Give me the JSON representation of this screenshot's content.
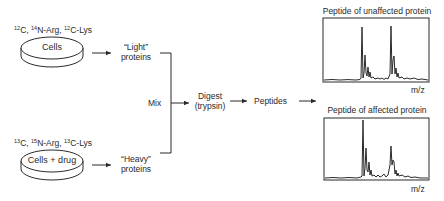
{
  "top_group": {
    "isotope_label": {
      "c": "12",
      "c_text": "C, ",
      "n": "14",
      "n_text": "N-Arg, ",
      "c2": "12",
      "c2_text": "C-Lys"
    },
    "dish_label": "Cells",
    "protein_label_line1": "“Light”",
    "protein_label_line2": "proteins"
  },
  "bottom_group": {
    "isotope_label": {
      "c": "13",
      "c_text": "C, ",
      "n": "15",
      "n_text": "N-Arg, ",
      "c2": "13",
      "c2_text": "C-Lys"
    },
    "dish_label": "Cells + drug",
    "protein_label_line1": "“Heavy”",
    "protein_label_line2": "proteins"
  },
  "steps": {
    "mix": "Mix",
    "digest_line1": "Digest",
    "digest_line2": "(trypsin)",
    "peptides": "Peptides"
  },
  "spectra": [
    {
      "title": "Peptide of unaffected protein",
      "xlabel": "m/z",
      "peak_light_height": 1.0,
      "peak_heavy_height": 1.0
    },
    {
      "title": "Peptide of affected protein",
      "xlabel": "m/z",
      "peak_light_height": 1.0,
      "peak_heavy_height": 0.55
    }
  ],
  "colors": {
    "line": "#2a2a2a",
    "background": "#ffffff"
  }
}
